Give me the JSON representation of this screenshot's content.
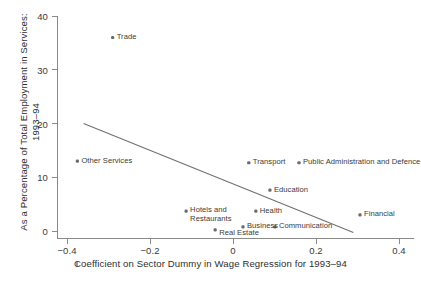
{
  "chart_data": {
    "type": "scatter",
    "title": "",
    "xlabel": "Coefficient on Sector Dummy in Wage Regression for 1993–94",
    "ylabel": "As a Percentage of Total Employment in Services: 1993–94",
    "xlim": [
      -0.45,
      0.43
    ],
    "ylim": [
      -1.5,
      41
    ],
    "xticks": [
      -0.4,
      -0.2,
      0,
      0.2,
      0.4
    ],
    "xticklabels": [
      "−0.4",
      "−0.2",
      "0",
      "0.2",
      "0.4"
    ],
    "yticks": [
      0,
      10,
      20,
      30,
      40
    ],
    "yticklabels": [
      "0",
      "10",
      "20",
      "30",
      "40"
    ],
    "grid": false,
    "legend": "none",
    "points": [
      {
        "label": "Trade",
        "x": -0.29,
        "y": 36.0,
        "label_pos": "right"
      },
      {
        "label": "Other Services",
        "x": -0.375,
        "y": 13.0,
        "label_pos": "right"
      },
      {
        "label": "Transport",
        "x": 0.038,
        "y": 12.7,
        "label_pos": "right"
      },
      {
        "label": "Public Administration and Defence",
        "x": 0.159,
        "y": 12.7,
        "label_pos": "right"
      },
      {
        "label": "Education",
        "x": 0.089,
        "y": 7.6,
        "label_pos": "right"
      },
      {
        "label": "Hotels and Restaurants",
        "x": -0.113,
        "y": 3.7,
        "label_pos": "right-wrap"
      },
      {
        "label": "Health",
        "x": 0.055,
        "y": 3.7,
        "label_pos": "right"
      },
      {
        "label": "Financial",
        "x": 0.306,
        "y": 3.0,
        "label_pos": "right"
      },
      {
        "label": "Business",
        "x": 0.024,
        "y": 0.75,
        "label_pos": "right"
      },
      {
        "label": "Communication",
        "x": 0.101,
        "y": 0.75,
        "label_pos": "right"
      },
      {
        "label": "Real Estate",
        "x": -0.043,
        "y": 0.2,
        "label_pos": "right-below"
      }
    ],
    "fit_line": {
      "name": "linear fit",
      "x": [
        -0.36,
        0.29
      ],
      "y": [
        20.0,
        -0.3
      ]
    },
    "marker_color": "#6b6b6b",
    "line_color": "#6f6f6f",
    "axis_color": "#8a8a8a"
  }
}
